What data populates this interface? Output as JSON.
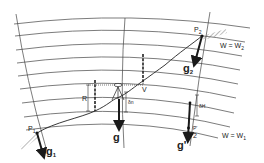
{
  "figure": {
    "type": "geodetic leveling diagram with equipotential surfaces",
    "colors": {
      "line": "#333333",
      "arrow": "#1a1a1a",
      "background": "#ffffff"
    }
  },
  "labels": {
    "p1": "P",
    "p1_sub": "1",
    "p2": "P",
    "p2_sub": "2",
    "p2_prime": "P'",
    "p2_prime_sub": "2",
    "g": "g",
    "g_prime": "g'",
    "g1": "g",
    "g1_sub": "1",
    "g2": "g",
    "g2_sub": "2",
    "R": "R",
    "V": "V",
    "delta_n": "δn",
    "delta_H": "δH",
    "w2": "W = W",
    "w2_sub": "2",
    "w1": "W = W",
    "w1_sub": "1"
  },
  "elements": {
    "equipotential_surfaces": 9,
    "plumb_lines": 3,
    "gravity_vectors": [
      "g1",
      "g",
      "g2",
      "g'"
    ],
    "leveling_staffs": [
      "R (backsight)",
      "V (foresight)"
    ],
    "instrument": "level on tripod"
  }
}
